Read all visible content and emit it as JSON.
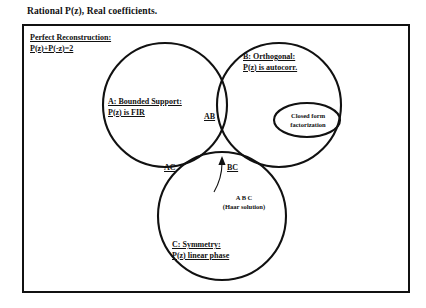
{
  "diagram": {
    "title": "Rational P(z), Real coefficients.",
    "perfect_reconstruction": {
      "line1": "Perfect Reconstruction:",
      "line2": "P(z)+P(-z)=2"
    },
    "sets": {
      "a": {
        "line1": "A: Bounded Support:",
        "line2": "P(z) is FIR"
      },
      "b": {
        "line1": "B: Orthogonal:",
        "line2": "P(z) is autocorr."
      },
      "c": {
        "line1": "C: Symmetry:",
        "line2": "P(z) linear phase"
      }
    },
    "intersections": {
      "ab": "AB",
      "ac": "AC",
      "bc": "BC"
    },
    "annotations": {
      "closed_form": {
        "line1": "Closed form",
        "line2": "factorization"
      },
      "haar": {
        "line1": "A B C",
        "line2": "(Haar solution)"
      }
    },
    "colors": {
      "stroke": "#111111",
      "background": "#ffffff"
    }
  }
}
